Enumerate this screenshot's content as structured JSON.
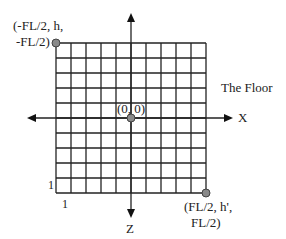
{
  "diagram": {
    "title_label": "The Floor",
    "grid": {
      "columns": 10,
      "rows": 10,
      "cell_unit_label_x": "1",
      "cell_unit_label_z": "1"
    },
    "axes": {
      "x_label": "X",
      "z_label": "Z"
    },
    "points": {
      "top_left": {
        "line1": "(-FL/2, h,",
        "line2": "-FL/2)"
      },
      "origin": {
        "label": "(0, 0)"
      },
      "bottom_right": {
        "line1": "(FL/2, h',",
        "line2": "FL/2)"
      }
    },
    "colors": {
      "line": "#222222",
      "point_fill": "#8a8a8a",
      "point_stroke": "#444444",
      "background": "#ffffff"
    }
  }
}
